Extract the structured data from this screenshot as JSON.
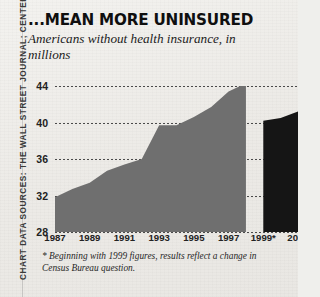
{
  "credit": {
    "text": "CHART DATA SOURCES: THE WALL STREET JOURNAL; CENTERS FOR M"
  },
  "header": {
    "title": "...MEAN MORE UNINSURED",
    "subtitle": "Americans without health insurance, in millions"
  },
  "footnote": {
    "text": "* Beginning with 1999 figures, results reflect a change in Census Bureau question."
  },
  "colors": {
    "area_gray": "#6f6f6f",
    "area_dark": "#151515",
    "gridline": "#4a4a4a",
    "background": "#efefec",
    "text": "#1b1b1b"
  },
  "chart_data": {
    "type": "area",
    "title": "...MEAN MORE UNINSURED",
    "subtitle": "Americans without health insurance, in millions",
    "xlabel": "",
    "ylabel": "in millions",
    "ylim": [
      28,
      44
    ],
    "xlim": [
      1987,
      2001
    ],
    "grid": true,
    "legend": "none",
    "ytick_labels": [
      "44",
      "40",
      "36",
      "32",
      "28"
    ],
    "yticks": [
      44,
      40,
      36,
      32,
      28
    ],
    "xtick_labels": [
      "1987",
      "1989",
      "1991",
      "1993",
      "1995",
      "1997",
      "1999*",
      "2001"
    ],
    "xticks": [
      1987,
      1989,
      1991,
      1993,
      1995,
      1997,
      1999,
      2001
    ],
    "annotations": [
      "* Beginning with 1999 figures, results reflect a change in Census Bureau question."
    ],
    "series": [
      {
        "name": "Uninsured Americans (pre-1999 methodology)",
        "color": "#6f6f6f",
        "x": [
          1987,
          1988,
          1989,
          1990,
          1991,
          1992,
          1993,
          1994,
          1995,
          1996,
          1997,
          1998
        ],
        "values": [
          31.8,
          32.7,
          33.4,
          34.7,
          35.4,
          36.0,
          39.7,
          39.7,
          40.6,
          41.7,
          43.4,
          44.3
        ]
      },
      {
        "name": "Uninsured Americans (revised Census question)",
        "color": "#151515",
        "x": [
          1999,
          2000,
          2001
        ],
        "values": [
          40.2,
          40.5,
          41.2
        ]
      }
    ]
  }
}
